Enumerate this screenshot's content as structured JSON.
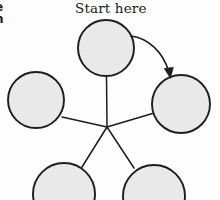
{
  "figure": {
    "type": "radial-spoke-diagram",
    "background_color": "#fdfdfd",
    "node_fill_color": "#e9e9e9",
    "stroke_color": "#1d1d1d",
    "caption": "Start here",
    "margin_text_fragments": [
      "e",
      "n"
    ],
    "hub": {
      "x": 107,
      "y": 127
    },
    "nodes": [
      {
        "id": "top",
        "label": "",
        "cx": 106,
        "cy": 48,
        "r": 28
      },
      {
        "id": "left",
        "label": "",
        "cx": 36,
        "cy": 100,
        "r": 28
      },
      {
        "id": "right",
        "label": "",
        "cx": 181,
        "cy": 104,
        "r": 29
      },
      {
        "id": "bottom-left",
        "label": "",
        "cx": 64,
        "cy": 194,
        "r": 31
      },
      {
        "id": "bottom-right",
        "label": "",
        "cx": 154,
        "cy": 196,
        "r": 31
      }
    ],
    "spokes": [
      {
        "from": "hub",
        "to": "top"
      },
      {
        "from": "hub",
        "to": "left"
      },
      {
        "from": "hub",
        "to": "right"
      },
      {
        "from": "hub",
        "to": "bottom-left"
      },
      {
        "from": "hub",
        "to": "bottom-right"
      }
    ],
    "flow_arrow": {
      "from": "top",
      "to": "right",
      "direction": "clockwise"
    }
  }
}
